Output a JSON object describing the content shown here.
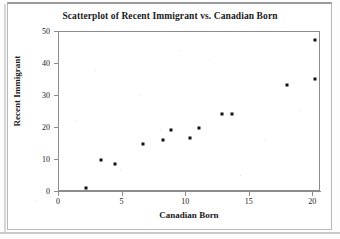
{
  "chart_data": {
    "type": "scatter",
    "title": "Scatterplot of Recent Immigrant vs. Canadian Born",
    "xlabel": "Canadian Born",
    "ylabel": "Recent Immigrant",
    "xlim": [
      0,
      20.6
    ],
    "ylim": [
      0,
      50
    ],
    "xticks": [
      0,
      5,
      10,
      15,
      20
    ],
    "xtick_labels": [
      "0",
      "5",
      "10",
      "15",
      "20"
    ],
    "yticks": [
      0,
      10,
      20,
      30,
      40,
      50
    ],
    "ytick_labels": [
      "0",
      "10",
      "20",
      "30",
      "40",
      "50"
    ],
    "grid": false,
    "legend": null,
    "marker": "filled-square",
    "marker_color": "#111111",
    "points": [
      {
        "x": 2.1,
        "y": 1.3
      },
      {
        "x": 3.3,
        "y": 10.0
      },
      {
        "x": 4.4,
        "y": 8.9
      },
      {
        "x": 6.6,
        "y": 15.0
      },
      {
        "x": 8.2,
        "y": 16.3
      },
      {
        "x": 8.8,
        "y": 19.4
      },
      {
        "x": 10.3,
        "y": 17.0
      },
      {
        "x": 11.0,
        "y": 20.1
      },
      {
        "x": 12.8,
        "y": 24.5
      },
      {
        "x": 13.6,
        "y": 24.3
      },
      {
        "x": 17.9,
        "y": 33.3
      },
      {
        "x": 20.1,
        "y": 35.2
      },
      {
        "x": 20.1,
        "y": 47.5
      }
    ]
  },
  "figure": {
    "title": "Scatterplot of Recent Immigrant vs. Canadian Born",
    "x_axis_title": "Canadian Born",
    "y_axis_title": "Recent Immigrant"
  }
}
